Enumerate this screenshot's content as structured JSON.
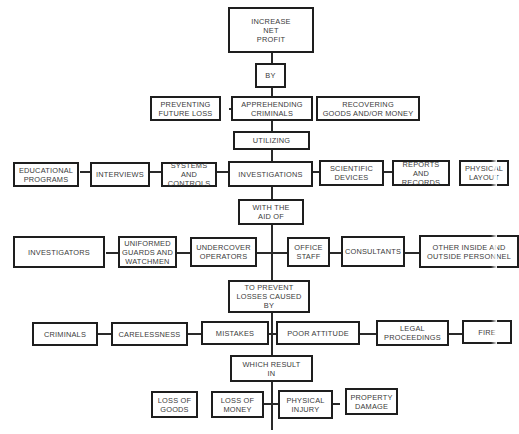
{
  "diagram": {
    "spine": [
      {
        "id": "increase-net-profit",
        "label": "INCREASE\nNET\nPROFIT"
      },
      {
        "id": "by",
        "label": "BY"
      },
      {
        "id": "apprehending-criminals",
        "label": "APPREHENDING\nCRIMINALS"
      },
      {
        "id": "utilizing",
        "label": "UTILIZING"
      },
      {
        "id": "investigations",
        "label": "INVESTIGATIONS"
      },
      {
        "id": "with-the-aid-of",
        "label": "WITH THE\nAID OF"
      },
      {
        "id": "to-prevent-losses",
        "label": "TO PREVENT\nLOSSES CAUSED\nBY"
      },
      {
        "id": "which-result-in",
        "label": "WHICH RESULT\nIN"
      }
    ],
    "row1": {
      "left": [
        {
          "id": "preventing-future-loss",
          "label": "PREVENTING\nFUTURE LOSS"
        }
      ],
      "right": [
        {
          "id": "recovering-goods",
          "label": "RECOVERING\nGOODS AND/OR MONEY"
        }
      ]
    },
    "row2": {
      "left": [
        {
          "id": "educational-programs",
          "label": "EDUCATIONAL\nPROGRAMS"
        },
        {
          "id": "interviews",
          "label": "INTERVIEWS"
        },
        {
          "id": "systems-and-controls",
          "label": "SYSTEMS AND\nCONTROLS"
        }
      ],
      "right": [
        {
          "id": "scientific-devices",
          "label": "SCIENTIFIC\nDEVICES"
        },
        {
          "id": "reports-and-records",
          "label": "REPORTS AND\nRECORDS"
        },
        {
          "id": "physical-layout",
          "label": "PHYSICAL\nLAYOUT"
        }
      ]
    },
    "row3": {
      "left": [
        {
          "id": "investigators",
          "label": "INVESTIGATORS"
        },
        {
          "id": "uniformed-guards",
          "label": "UNIFORMED\nGUARDS AND\nWATCHMEN"
        },
        {
          "id": "undercover-operators",
          "label": "UNDERCOVER\nOPERATORS"
        }
      ],
      "right": [
        {
          "id": "office-staff",
          "label": "OFFICE\nSTAFF"
        },
        {
          "id": "consultants",
          "label": "CONSULTANTS"
        },
        {
          "id": "other-personnel",
          "label": "OTHER INSIDE AND\nOUTSIDE PERSONNEL"
        }
      ]
    },
    "row4": {
      "left": [
        {
          "id": "criminals",
          "label": "CRIMINALS"
        },
        {
          "id": "carelessness",
          "label": "CARELESSNESS"
        },
        {
          "id": "mistakes",
          "label": "MISTAKES"
        }
      ],
      "right": [
        {
          "id": "poor-attitude",
          "label": "POOR ATTITUDE"
        },
        {
          "id": "legal-proceedings",
          "label": "LEGAL\nPROCEEDINGS"
        },
        {
          "id": "fire",
          "label": "FIRE"
        }
      ]
    },
    "row5": [
      {
        "id": "loss-of-goods",
        "label": "LOSS OF\nGOODS"
      },
      {
        "id": "loss-of-money",
        "label": "LOSS OF\nMONEY"
      },
      {
        "id": "physical-injury",
        "label": "PHYSICAL\nINJURY"
      },
      {
        "id": "property-damage",
        "label": "PROPERTY\nDAMAGE"
      }
    ]
  }
}
